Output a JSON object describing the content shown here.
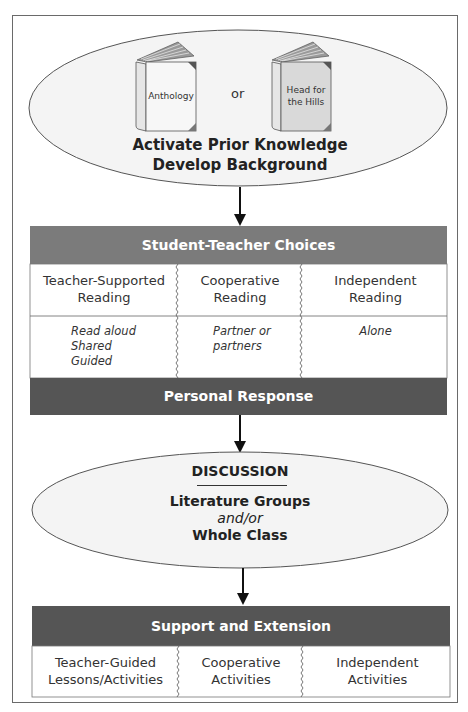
{
  "diagram": {
    "top_ellipse": {
      "books": [
        {
          "title": "Anthology"
        },
        {
          "title_line1": "Head for",
          "title_line2": "the Hills"
        }
      ],
      "connector": "or",
      "heading_line1": "Activate Prior Knowledge",
      "heading_line2": "Develop Background"
    },
    "choices": {
      "header": "Student-Teacher Choices",
      "columns": [
        {
          "title_line1": "Teacher-Supported",
          "title_line2": "Reading",
          "details": [
            "Read aloud",
            "Shared",
            "Guided"
          ]
        },
        {
          "title_line1": "Cooperative",
          "title_line2": "Reading",
          "details": [
            "Partner or",
            "partners"
          ]
        },
        {
          "title_line1": "Independent",
          "title_line2": "Reading",
          "details": [
            "Alone"
          ]
        }
      ],
      "footer": "Personal Response"
    },
    "discussion": {
      "title": "DISCUSSION",
      "line1": "Literature Groups",
      "line2": "and/or",
      "line3": "Whole Class"
    },
    "support": {
      "header": "Support and Extension",
      "columns": [
        {
          "line1": "Teacher-Guided",
          "line2": "Lessons/Activities"
        },
        {
          "line1": "Cooperative",
          "line2": "Activities"
        },
        {
          "line1": "Independent",
          "line2": "Activities"
        }
      ]
    },
    "colors": {
      "choices_header": "#7b7b7b",
      "dark_bar": "#555555",
      "ellipse_fill": "#f3f3f3",
      "book2_cover": "#d9d9d9"
    }
  }
}
